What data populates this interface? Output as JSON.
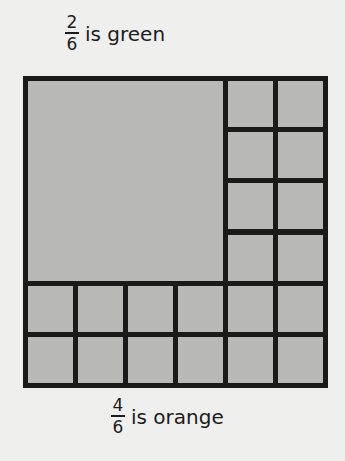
{
  "captions": {
    "top": {
      "numerator": "2",
      "denominator": "6",
      "text": "is green"
    },
    "bottom": {
      "numerator": "4",
      "denominator": "6",
      "text": "is orange"
    }
  },
  "diagram": {
    "type": "fraction-area-model",
    "grid_rows": 6,
    "grid_cols": 6,
    "large_block": {
      "label": "green part",
      "rows": 4,
      "cols": 4,
      "position": "top-left"
    },
    "small_squares_count": 20,
    "colors": {
      "fill": "#b9b9b7",
      "lines": "#1a1a1a",
      "background": "#efefed"
    }
  }
}
